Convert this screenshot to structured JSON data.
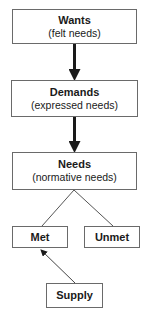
{
  "diagram": {
    "nodes": {
      "wants": {
        "title": "Wants",
        "subtitle": "(felt needs)"
      },
      "demands": {
        "title": "Demands",
        "subtitle": "(expressed needs)"
      },
      "needs": {
        "title": "Needs",
        "subtitle": "(normative needs)"
      },
      "met": {
        "title": "Met"
      },
      "unmet": {
        "title": "Unmet"
      },
      "supply": {
        "title": "Supply"
      }
    },
    "edges": [
      {
        "from": "Wants",
        "to": "Demands",
        "style": "thick-arrow"
      },
      {
        "from": "Demands",
        "to": "Needs",
        "style": "thick-arrow"
      },
      {
        "from": "Needs",
        "to": "Met",
        "style": "line"
      },
      {
        "from": "Needs",
        "to": "Unmet",
        "style": "line"
      },
      {
        "from": "Supply",
        "to": "Met",
        "style": "thin-arrow"
      }
    ],
    "colors": {
      "border": "#6a6a6a",
      "arrow": "#1a1a1a",
      "background": "#ffffff"
    }
  }
}
